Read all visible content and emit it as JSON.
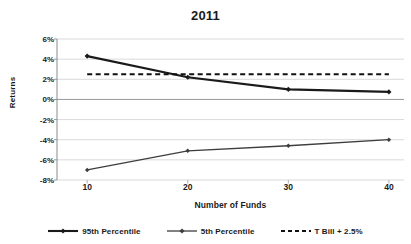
{
  "chart_data": {
    "type": "line",
    "title": "2011",
    "clipped_header": "",
    "xlabel": "Number of Funds",
    "ylabel": "Returns",
    "x": [
      10,
      20,
      30,
      40
    ],
    "xticks": [
      "10",
      "20",
      "30",
      "40"
    ],
    "yticks": [
      "6%",
      "4%",
      "2%",
      "0%",
      "-2%",
      "-4%",
      "-6%",
      "-8%"
    ],
    "ytick_values": [
      6,
      4,
      2,
      0,
      -2,
      -4,
      -6,
      -8
    ],
    "ylim": [
      -8,
      6
    ],
    "xlim": [
      7,
      41.5
    ],
    "grid": true,
    "legend_position": "bottom",
    "series": [
      {
        "name": "95th Percentile",
        "style": "solid",
        "marker": "diamond",
        "color": "#1a1a1a",
        "width": 2.1,
        "values": [
          4.3,
          2.2,
          1.0,
          0.75
        ]
      },
      {
        "name": "5th Percentile",
        "style": "solid",
        "marker": "diamond",
        "color": "#3d3d3d",
        "width": 1.3,
        "values": [
          -7.0,
          -5.1,
          -4.6,
          -4.0
        ]
      },
      {
        "name": "T Bill + 2.5%",
        "style": "dashed",
        "marker": "none",
        "color": "#111111",
        "width": 2.0,
        "values": [
          2.5,
          2.5,
          2.5,
          2.5
        ]
      }
    ]
  }
}
